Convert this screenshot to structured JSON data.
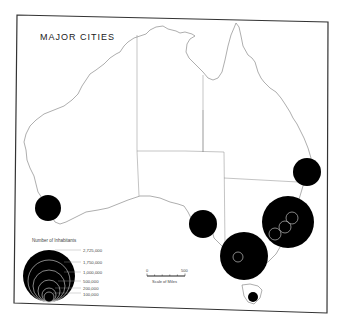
{
  "map": {
    "title": "MAJOR CITIES",
    "frame_color": "#333333",
    "coast_color": "#666666",
    "city_fill": "#000000",
    "inner_ring_color": "#bbbbbb"
  },
  "cities": [
    {
      "name": "Perth",
      "cx": 48,
      "cy": 208,
      "r": 13
    },
    {
      "name": "Adelaide",
      "cx": 203,
      "cy": 224,
      "r": 14
    },
    {
      "name": "Melbourne",
      "cx": 244,
      "cy": 256,
      "r": 24
    },
    {
      "name": "Sydney",
      "cx": 288,
      "cy": 222,
      "r": 26
    },
    {
      "name": "Brisbane",
      "cx": 307,
      "cy": 172,
      "r": 14
    },
    {
      "name": "Hobart",
      "cx": 253,
      "cy": 297,
      "r": 5
    }
  ],
  "legend": {
    "title": "Number of Inhabitants",
    "items": [
      {
        "label": "2,725,000",
        "r": 26
      },
      {
        "label": "1,750,000",
        "r": 21
      },
      {
        "label": "1,000,000",
        "r": 16
      },
      {
        "label": "500,000",
        "r": 11
      },
      {
        "label": "200,000",
        "r": 7
      },
      {
        "label": "100,000",
        "r": 5
      }
    ]
  },
  "scale": {
    "start_label": "0",
    "end_label": "500",
    "caption": "Scale of Miles"
  }
}
